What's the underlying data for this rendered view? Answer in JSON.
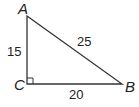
{
  "diagram": {
    "type": "right-triangle",
    "vertices": {
      "A": "A",
      "B": "B",
      "C": "C"
    },
    "right_angle_at": "C",
    "sides": {
      "AC": "15",
      "AB": "25",
      "CB": "20"
    },
    "colors": {
      "stroke": "#333333",
      "text": "#222222"
    }
  }
}
